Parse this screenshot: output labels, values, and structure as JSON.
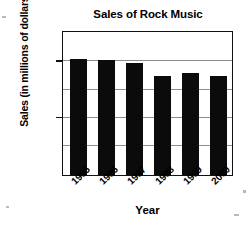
{
  "chart_data": {
    "type": "bar",
    "title": "Sales of Rock Music",
    "xlabel": "Year",
    "ylabel": "Sales (in millions of dollars)",
    "categories": [
      "1995",
      "1996",
      "1997",
      "1998",
      "1999",
      "2000"
    ],
    "values": [
      4100,
      4050,
      3950,
      3500,
      3600,
      3500
    ],
    "ylim": [
      0,
      5000
    ],
    "yticks": [
      0,
      2000,
      4000
    ],
    "ytick_labels": [
      "0",
      "2000",
      "4000"
    ],
    "gridlines": [
      1000,
      2000,
      3000,
      4000
    ],
    "grid": true,
    "legend": null,
    "bar_color": "#0b0b0b",
    "grid_color": "#8d8d8d",
    "frame_color": "#111111",
    "background": "#ffffff",
    "xtick_rotation": -45
  },
  "axis": {
    "y_title": "Sales (in millions of dollars)",
    "x_title": "Year"
  }
}
